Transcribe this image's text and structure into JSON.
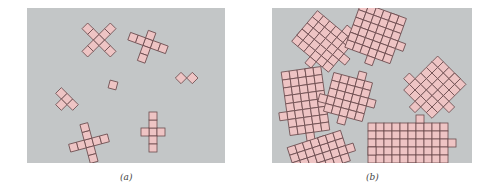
{
  "figure": {
    "colors": {
      "background": "#c3c6c7",
      "cell_fill": "#eec4c4",
      "cell_stroke": "#6b4b4e"
    },
    "cell_size": 8,
    "panels": [
      {
        "id": "a",
        "caption": "(a)",
        "description": "Sparse set of small shapes made of square cells",
        "shapes": [
          {
            "name": "x-diagonal",
            "cx": 72,
            "cy": 32,
            "rot": 45,
            "cells": [
              [
                0,
                0
              ],
              [
                -1,
                0
              ],
              [
                -2,
                0
              ],
              [
                1,
                0
              ],
              [
                2,
                0
              ],
              [
                0,
                -1
              ],
              [
                0,
                -2
              ],
              [
                0,
                1
              ],
              [
                0,
                2
              ]
            ]
          },
          {
            "name": "cross-tilted",
            "cx": 121,
            "cy": 35,
            "rot": 20,
            "cells": [
              [
                0,
                0
              ],
              [
                -1,
                0
              ],
              [
                -2,
                0
              ],
              [
                1,
                0
              ],
              [
                2,
                0
              ],
              [
                0,
                -1
              ],
              [
                0,
                1
              ],
              [
                0,
                2
              ]
            ]
          },
          {
            "name": "domino-diagonal",
            "cx": 154,
            "cy": 70,
            "rot": 45,
            "cells": [
              [
                0,
                0
              ],
              [
                1,
                -1
              ]
            ]
          },
          {
            "name": "single-square",
            "cx": 86,
            "cy": 77,
            "rot": 15,
            "cells": [
              [
                0,
                0
              ]
            ]
          },
          {
            "name": "small-diagonal",
            "cx": 40,
            "cy": 91,
            "rot": 45,
            "cells": [
              [
                0,
                0
              ],
              [
                -1,
                0
              ],
              [
                1,
                0
              ],
              [
                0,
                1
              ]
            ]
          },
          {
            "name": "cross-bottom-left",
            "cx": 62,
            "cy": 135,
            "rot": -15,
            "cells": [
              [
                0,
                0
              ],
              [
                -1,
                0
              ],
              [
                -2,
                0
              ],
              [
                1,
                0
              ],
              [
                2,
                0
              ],
              [
                0,
                -1
              ],
              [
                0,
                -2
              ],
              [
                0,
                1
              ],
              [
                0,
                2
              ]
            ]
          },
          {
            "name": "cross-upright",
            "cx": 126,
            "cy": 124,
            "rot": 0,
            "cells": [
              [
                0,
                0
              ],
              [
                -1,
                0
              ],
              [
                1,
                0
              ],
              [
                0,
                -1
              ],
              [
                0,
                -2
              ],
              [
                0,
                1
              ],
              [
                0,
                2
              ]
            ]
          }
        ]
      },
      {
        "id": "b",
        "caption": "(b)",
        "description": "Dense cluster of large interlocking shapes made of square cells",
        "shapes": [
          {
            "name": "blob-top-left",
            "cx": 54,
            "cy": 36,
            "rot": 40,
            "w": 6,
            "h": 5
          },
          {
            "name": "blob-top-middle",
            "cx": 106,
            "cy": 30,
            "rot": 20,
            "w": 6,
            "h": 6
          },
          {
            "name": "blob-right",
            "cx": 160,
            "cy": 82,
            "rot": 45,
            "w": 5,
            "h": 6
          },
          {
            "name": "blob-left",
            "cx": 34,
            "cy": 97,
            "rot": -8,
            "w": 5,
            "h": 8
          },
          {
            "name": "blob-center",
            "cx": 76,
            "cy": 89,
            "rot": 15,
            "w": 5,
            "h": 5
          },
          {
            "name": "blob-bottom-left",
            "cx": 48,
            "cy": 150,
            "rot": -18,
            "w": 7,
            "h": 4
          },
          {
            "name": "blob-bottom-right",
            "cx": 140,
            "cy": 135,
            "rot": 0,
            "w": 10,
            "h": 5
          }
        ]
      }
    ]
  }
}
